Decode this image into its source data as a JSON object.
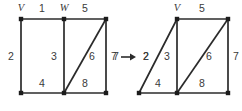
{
  "diagram": {
    "type": "graph-transformation",
    "colors": {
      "line": "#2b2b2b",
      "vertex": "#1c1c1c",
      "label": "#3a3a3a",
      "background": "#ffffff"
    },
    "left_figure": {
      "name": "left-graph",
      "vertices": [
        {
          "id": "tl",
          "label": "V",
          "x": 21,
          "y": 19,
          "label_x": 21,
          "label_y": 9
        },
        {
          "id": "tm",
          "label": "W",
          "x": 64,
          "y": 19,
          "label_x": 64,
          "label_y": 9
        },
        {
          "id": "tr",
          "label": "",
          "x": 106,
          "y": 19,
          "label_x": 0,
          "label_y": 0
        },
        {
          "id": "bl",
          "label": "",
          "x": 21,
          "y": 93,
          "label_x": 0,
          "label_y": 0
        },
        {
          "id": "bm",
          "label": "",
          "x": 64,
          "y": 93,
          "label_x": 0,
          "label_y": 0
        },
        {
          "id": "br",
          "label": "",
          "x": 106,
          "y": 93,
          "label_x": 0,
          "label_y": 0
        }
      ],
      "edges": [
        {
          "id": "e1",
          "label": "1",
          "x1": 21,
          "y1": 19,
          "x2": 64,
          "y2": 19,
          "label_x": 42,
          "label_y": 9
        },
        {
          "id": "e5",
          "label": "5",
          "x1": 64,
          "y1": 19,
          "x2": 106,
          "y2": 19,
          "label_x": 85,
          "label_y": 9
        },
        {
          "id": "e2",
          "label": "2",
          "x1": 21,
          "y1": 19,
          "x2": 21,
          "y2": 93,
          "label_x": 11,
          "label_y": 57
        },
        {
          "id": "e3",
          "label": "3",
          "x1": 64,
          "y1": 19,
          "x2": 64,
          "y2": 93,
          "label_x": 54,
          "label_y": 57
        },
        {
          "id": "e7",
          "label": "7",
          "x1": 106,
          "y1": 19,
          "x2": 106,
          "y2": 93,
          "label_x": 116,
          "label_y": 57
        },
        {
          "id": "e4",
          "label": "4",
          "x1": 21,
          "y1": 93,
          "x2": 64,
          "y2": 93,
          "label_x": 42,
          "label_y": 84
        },
        {
          "id": "e8",
          "label": "8",
          "x1": 64,
          "y1": 93,
          "x2": 106,
          "y2": 93,
          "label_x": 85,
          "label_y": 84
        },
        {
          "id": "e6",
          "label": "6",
          "x1": 64,
          "y1": 93,
          "x2": 106,
          "y2": 19,
          "label_x": 92,
          "label_y": 57
        }
      ]
    },
    "arrow": {
      "name": "transformation-arrow",
      "left_label": "7",
      "right_label": "2",
      "left_label_x": 114,
      "left_label_y": 57,
      "right_label_x": 146,
      "right_label_y": 57,
      "shaft_x1": 121,
      "shaft_x2": 136,
      "shaft_y": 57
    },
    "right_figure": {
      "name": "right-graph",
      "vertices": [
        {
          "id": "tl",
          "label": "V",
          "x": 177,
          "y": 19,
          "label_x": 177,
          "label_y": 9
        },
        {
          "id": "tr",
          "label": "",
          "x": 228,
          "y": 19,
          "label_x": 0,
          "label_y": 0
        },
        {
          "id": "bl",
          "label": "",
          "x": 139,
          "y": 93,
          "label_x": 0,
          "label_y": 0
        },
        {
          "id": "bm",
          "label": "",
          "x": 177,
          "y": 93,
          "label_x": 0,
          "label_y": 0
        },
        {
          "id": "br",
          "label": "",
          "x": 228,
          "y": 93,
          "label_x": 0,
          "label_y": 0
        }
      ],
      "edges": [
        {
          "id": "e5",
          "label": "5",
          "x1": 177,
          "y1": 19,
          "x2": 228,
          "y2": 19,
          "label_x": 202,
          "label_y": 9
        },
        {
          "id": "e2",
          "label": "2",
          "x1": 139,
          "y1": 93,
          "x2": 177,
          "y2": 19,
          "label_x": 146,
          "label_y": 57
        },
        {
          "id": "e3",
          "label": "3",
          "x1": 177,
          "y1": 19,
          "x2": 177,
          "y2": 93,
          "label_x": 167,
          "label_y": 57
        },
        {
          "id": "e7",
          "label": "7",
          "x1": 228,
          "y1": 19,
          "x2": 228,
          "y2": 93,
          "label_x": 236,
          "label_y": 57
        },
        {
          "id": "e4",
          "label": "4",
          "x1": 139,
          "y1": 93,
          "x2": 177,
          "y2": 93,
          "label_x": 158,
          "label_y": 84
        },
        {
          "id": "e8",
          "label": "8",
          "x1": 177,
          "y1": 93,
          "x2": 228,
          "y2": 93,
          "label_x": 202,
          "label_y": 84
        },
        {
          "id": "e6",
          "label": "6",
          "x1": 177,
          "y1": 93,
          "x2": 228,
          "y2": 19,
          "label_x": 209,
          "label_y": 57
        }
      ]
    }
  }
}
